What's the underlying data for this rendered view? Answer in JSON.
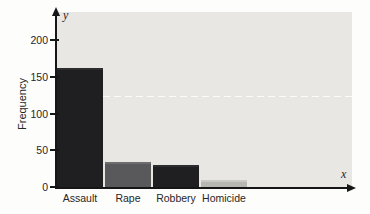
{
  "chart_data": {
    "type": "bar",
    "title": "",
    "categories": [
      "Assault",
      "Rape",
      "Robbery",
      "Homicide"
    ],
    "values": [
      162,
      34,
      30,
      10
    ],
    "xlabel": "x",
    "ylabel": "Frequency",
    "x_var_label": "x",
    "y_var_label": "y",
    "ylim": [
      0,
      240
    ],
    "yticks": [
      0,
      50,
      100,
      150,
      200
    ],
    "grid": false,
    "legend": "none",
    "colors": {
      "bars": [
        "#1f1f21",
        "#59595b",
        "#1f1f21",
        "#b6b6b3"
      ],
      "bar_highlights": [
        "#2d2d2f",
        "#6d6d6f",
        "#2d2d2f",
        "#c9c9c6"
      ],
      "plot_background": "#e8e7e4",
      "page_background": "#fdfdfc",
      "axis": "#161616",
      "text": "#262626"
    }
  }
}
